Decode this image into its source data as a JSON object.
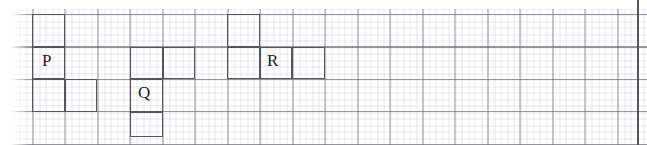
{
  "figure": {
    "kind": "grid-polyomino-figure",
    "background": "graph-paper",
    "canvas": {
      "width": 647,
      "height": 145
    },
    "grid": {
      "minor_spacing_px": 6.5,
      "major_spacing_px": 32.5,
      "minor_color": "#787896",
      "major_color": "#6e6e7d",
      "origin_x": 32.5,
      "origin_y": 14
    },
    "border": {
      "side": "right",
      "x": 637,
      "color": "#555560"
    },
    "cell_size_px": 32.5,
    "stroke_color": "#55555e",
    "stroke_width_px": 1.6,
    "label_color": "#1d1d22"
  },
  "shapes": [
    {
      "id": "shape-p",
      "label": "P",
      "label_x": 42,
      "label_y": 52,
      "cells": [
        {
          "name": "p-cell-top",
          "x": 32,
          "y": 14,
          "w": 32.5,
          "h": 32.5
        },
        {
          "name": "p-cell-middle-label",
          "x": 32,
          "y": 46.5,
          "w": 32.5,
          "h": 32.5
        },
        {
          "name": "p-cell-bottom-left",
          "x": 32,
          "y": 79,
          "w": 32.5,
          "h": 32.5
        },
        {
          "name": "p-cell-bottom-right",
          "x": 64.5,
          "y": 79,
          "w": 32.5,
          "h": 32.5
        }
      ]
    },
    {
      "id": "shape-q",
      "label": "Q",
      "label_x": 138,
      "label_y": 84,
      "cells": [
        {
          "name": "q-cell-top-left",
          "x": 130,
          "y": 46.5,
          "w": 32.5,
          "h": 32.5
        },
        {
          "name": "q-cell-top-right",
          "x": 162.5,
          "y": 46.5,
          "w": 32.5,
          "h": 32.5
        },
        {
          "name": "q-cell-middle-label",
          "x": 130,
          "y": 79,
          "w": 32.5,
          "h": 32.5
        },
        {
          "name": "q-cell-bottom",
          "x": 130,
          "y": 111.5,
          "w": 32.5,
          "h": 25
        }
      ]
    },
    {
      "id": "shape-r",
      "label": "R",
      "label_x": 267,
      "label_y": 52,
      "cells": [
        {
          "name": "r-cell-top-left",
          "x": 227,
          "y": 14,
          "w": 32.5,
          "h": 32.5
        },
        {
          "name": "r-cell-bottom-left",
          "x": 227,
          "y": 46.5,
          "w": 32.5,
          "h": 32.5
        },
        {
          "name": "r-cell-bottom-middle",
          "x": 259.5,
          "y": 46.5,
          "w": 32.5,
          "h": 32.5
        },
        {
          "name": "r-cell-bottom-right",
          "x": 292,
          "y": 46.5,
          "w": 32.5,
          "h": 32.5
        }
      ]
    }
  ]
}
